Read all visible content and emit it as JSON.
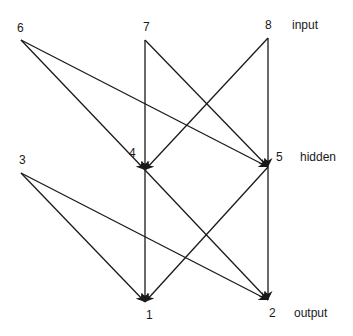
{
  "diagram": {
    "type": "neural-network",
    "layers": {
      "input": "input",
      "hidden": "hidden",
      "output": "output"
    },
    "nodes": [
      {
        "id": "6",
        "label": "6",
        "layer": "input",
        "x": 21,
        "y": 40,
        "lx": 17,
        "ly": 22
      },
      {
        "id": "7",
        "label": "7",
        "layer": "input",
        "x": 145,
        "y": 40,
        "lx": 143,
        "ly": 21
      },
      {
        "id": "8",
        "label": "8",
        "layer": "input",
        "x": 268,
        "y": 38,
        "lx": 265,
        "ly": 19
      },
      {
        "id": "3",
        "label": "3",
        "layer": "hidden",
        "x": 21,
        "y": 173,
        "lx": 19,
        "ly": 154
      },
      {
        "id": "4",
        "label": "4",
        "layer": "hidden",
        "x": 145,
        "y": 170,
        "lx": 129,
        "ly": 147
      },
      {
        "id": "5",
        "label": "5",
        "layer": "hidden",
        "x": 268,
        "y": 167,
        "lx": 276,
        "ly": 151
      },
      {
        "id": "1",
        "label": "1",
        "layer": "output",
        "x": 145,
        "y": 302,
        "lx": 146,
        "ly": 309
      },
      {
        "id": "2",
        "label": "2",
        "layer": "output",
        "x": 268,
        "y": 300,
        "lx": 269,
        "ly": 307
      }
    ],
    "edges": [
      {
        "from": "6",
        "to": "4"
      },
      {
        "from": "6",
        "to": "5"
      },
      {
        "from": "7",
        "to": "4"
      },
      {
        "from": "7",
        "to": "5"
      },
      {
        "from": "8",
        "to": "4"
      },
      {
        "from": "8",
        "to": "5"
      },
      {
        "from": "3",
        "to": "1"
      },
      {
        "from": "3",
        "to": "2"
      },
      {
        "from": "4",
        "to": "1"
      },
      {
        "from": "4",
        "to": "2"
      },
      {
        "from": "5",
        "to": "1"
      },
      {
        "from": "5",
        "to": "2"
      }
    ],
    "layer_labels": [
      {
        "text": "input",
        "x": 292,
        "y": 19
      },
      {
        "text": "hidden",
        "x": 300,
        "y": 151
      },
      {
        "text": "output",
        "x": 294,
        "y": 307
      }
    ],
    "colors": {
      "line": "#1a1a1a",
      "background": "#ffffff"
    }
  }
}
